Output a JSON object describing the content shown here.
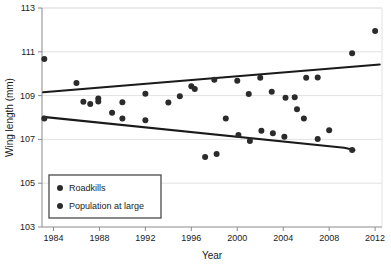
{
  "chart_data": {
    "type": "scatter",
    "title": "",
    "xlabel": "Year",
    "ylabel": "Wing length (mm)",
    "xlim": [
      1983,
      2012.6
    ],
    "ylim": [
      103,
      113
    ],
    "xticks": [
      1984,
      1988,
      1992,
      1996,
      2000,
      2004,
      2008,
      2012
    ],
    "yticks": [
      103,
      105,
      107,
      109,
      111,
      113
    ],
    "xtick_labels": [
      "1984",
      "1988",
      "1992",
      "1996",
      "2000",
      "2004",
      "2008",
      "2012"
    ],
    "ytick_labels": [
      "103",
      "105",
      "107",
      "109",
      "111",
      "113"
    ],
    "grid": "horizontal",
    "legend_position": "lower-left",
    "marker_color": "#2b2b2b",
    "line_color": "#1a1a1a",
    "axis_color": "#9a9a9a",
    "grid_color": "#e2e2e2",
    "series": [
      {
        "name": "Roadkills",
        "points": [
          [
            1983.2,
            110.67
          ],
          [
            1986.0,
            109.57
          ],
          [
            1987.9,
            108.87
          ],
          [
            1990.0,
            108.7
          ],
          [
            1992.0,
            109.08
          ],
          [
            1995.0,
            108.97
          ],
          [
            1996.0,
            109.43
          ],
          [
            1998.0,
            109.72
          ],
          [
            2000.0,
            109.68
          ],
          [
            2001.0,
            109.07
          ],
          [
            2002.0,
            109.82
          ],
          [
            2003.0,
            109.18
          ],
          [
            2004.2,
            108.9
          ],
          [
            2005.0,
            108.93
          ],
          [
            2005.2,
            108.38
          ],
          [
            2006.0,
            109.82
          ],
          [
            2007.0,
            109.83
          ],
          [
            2010.0,
            110.93
          ],
          [
            2012.0,
            111.95
          ]
        ]
      },
      {
        "name": "Population at large",
        "points": [
          [
            1983.2,
            107.95
          ],
          [
            1986.6,
            108.72
          ],
          [
            1987.2,
            108.62
          ],
          [
            1987.9,
            108.73
          ],
          [
            1989.1,
            108.22
          ],
          [
            1990.0,
            107.95
          ],
          [
            1992.0,
            107.88
          ],
          [
            1994.0,
            108.68
          ],
          [
            1996.3,
            109.3
          ],
          [
            1997.2,
            106.2
          ],
          [
            1998.2,
            106.33
          ],
          [
            1999.0,
            107.95
          ],
          [
            2000.1,
            107.2
          ],
          [
            2001.1,
            106.93
          ],
          [
            2002.1,
            107.4
          ],
          [
            2003.1,
            107.28
          ],
          [
            2004.1,
            107.12
          ],
          [
            2005.8,
            107.95
          ],
          [
            2007.0,
            107.02
          ],
          [
            2008.0,
            107.42
          ],
          [
            2010.0,
            106.52
          ]
        ]
      }
    ],
    "trendlines": [
      {
        "name": "Roadkills trend",
        "x1": 1983.1,
        "y1": 109.15,
        "x2": 2012.4,
        "y2": 110.42
      },
      {
        "name": "Population at large trend",
        "x1": 1983.1,
        "y1": 108.03,
        "x2": 2009.3,
        "y2": 106.62,
        "x3": 2010.2,
        "y3": 106.52
      }
    ],
    "legend": [
      {
        "label": "Roadkills",
        "marker": "filled-circle",
        "color": "#2b2b2b"
      },
      {
        "label": "Population at large",
        "marker": "filled-circle",
        "color": "#2b2b2b"
      }
    ]
  }
}
